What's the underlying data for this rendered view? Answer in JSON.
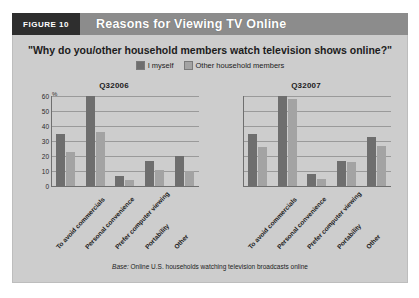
{
  "header": {
    "figure_tag": "FIGURE 10",
    "title": "Reasons for Viewing TV Online"
  },
  "subtitle": "\"Why do you/other household members watch television shows online?\"",
  "legend": [
    {
      "label": "I myself",
      "color": "#6e6e6e"
    },
    {
      "label": "Other household members",
      "color": "#a3a3a3"
    }
  ],
  "axis": {
    "unit": "%",
    "ticks": [
      "0",
      "10",
      "20",
      "30",
      "40",
      "50",
      "60"
    ]
  },
  "base_note_prefix": "Base:",
  "base_note": "Online U.S. households watching television broadcasts online",
  "chart_data": [
    {
      "type": "bar",
      "title": "Q32006",
      "xlabel": "",
      "ylabel": "%",
      "ylim": [
        0,
        60
      ],
      "grid": true,
      "legend_position": "top-center",
      "categories": [
        "To avoid commercials",
        "Personal convenience",
        "Prefer computer viewing",
        "Portability",
        "Other"
      ],
      "series": [
        {
          "name": "I myself",
          "values": [
            35,
            60,
            7,
            17,
            20
          ]
        },
        {
          "name": "Other household members",
          "values": [
            23,
            36,
            4,
            11,
            10
          ]
        }
      ]
    },
    {
      "type": "bar",
      "title": "Q32007",
      "xlabel": "",
      "ylabel": "%",
      "ylim": [
        0,
        60
      ],
      "grid": true,
      "legend_position": "top-center",
      "categories": [
        "To avoid commercials",
        "Personal convenience",
        "Prefer computer viewing",
        "Portability",
        "Other"
      ],
      "series": [
        {
          "name": "I myself",
          "values": [
            35,
            60,
            8,
            17,
            33
          ]
        },
        {
          "name": "Other household members",
          "values": [
            26,
            58,
            5,
            16,
            27
          ]
        }
      ]
    }
  ]
}
